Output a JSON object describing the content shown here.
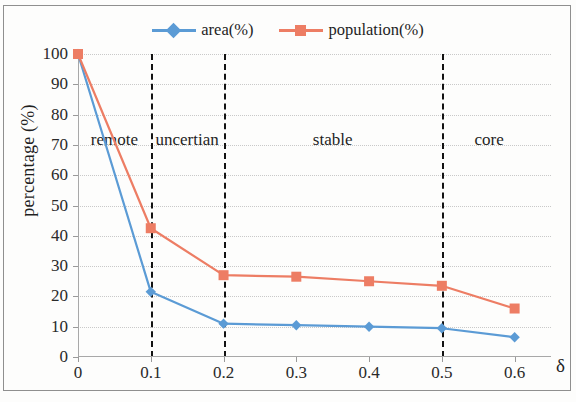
{
  "chart_data": {
    "type": "line",
    "title": "",
    "xlabel": "δ",
    "ylabel": "percentage (%)",
    "x": [
      0,
      0.1,
      0.2,
      0.3,
      0.4,
      0.5,
      0.6
    ],
    "xticks": [
      "0",
      "0.1",
      "0.2",
      "0.3",
      "0.4",
      "0.5",
      "0.6"
    ],
    "yticks": [
      "0",
      "10",
      "20",
      "30",
      "40",
      "50",
      "60",
      "70",
      "80",
      "90",
      "100"
    ],
    "xlim": [
      0,
      0.65
    ],
    "ylim": [
      0,
      100
    ],
    "grid": true,
    "legend_position": "top-center",
    "series": [
      {
        "name": "area(%)",
        "color": "#5B9BD5",
        "marker": "diamond",
        "values": [
          100,
          21.5,
          11,
          10.5,
          10,
          9.5,
          6.5
        ]
      },
      {
        "name": "population(%)",
        "color": "#ED7D64",
        "marker": "square",
        "values": [
          100,
          42.5,
          27,
          26.5,
          25,
          23.5,
          16
        ]
      }
    ],
    "annotations": [
      {
        "label": "remote",
        "x_center": 0.05
      },
      {
        "label": "uncertian",
        "x_center": 0.15
      },
      {
        "label": "stable",
        "x_center": 0.35
      },
      {
        "label": "core",
        "x_center": 0.565
      }
    ],
    "dividers": [
      0.1,
      0.2,
      0.5
    ]
  },
  "legend": {
    "entries": [
      {
        "label": "area(%)"
      },
      {
        "label": "population(%)"
      }
    ]
  }
}
